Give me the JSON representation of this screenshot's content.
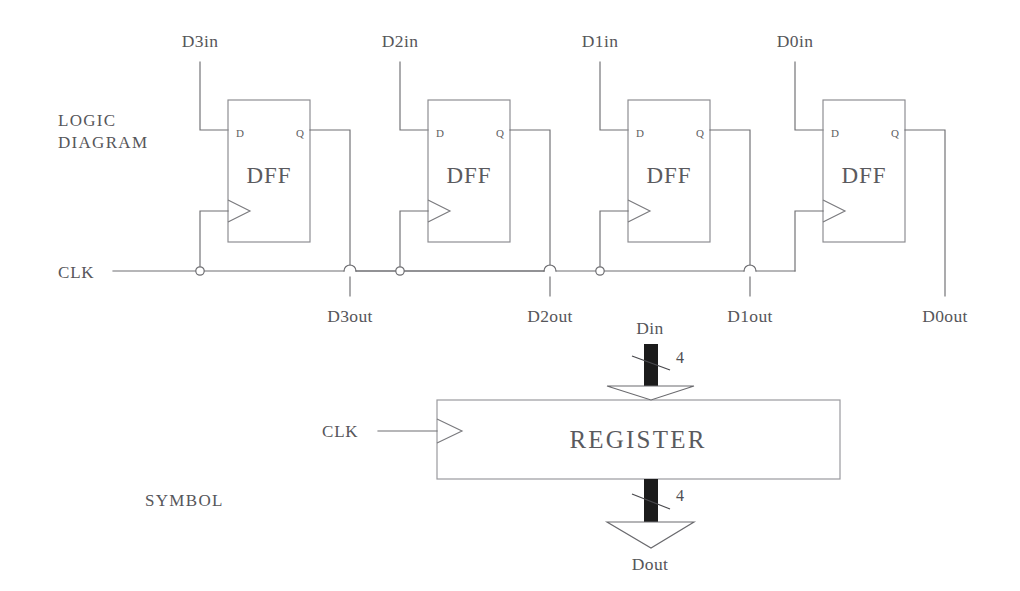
{
  "figure": {
    "sections": {
      "logic_diagram_line1": "LOGIC",
      "logic_diagram_line2": "DIAGRAM",
      "symbol": "SYMBOL"
    },
    "clock_label": "CLK",
    "logic_diagram": {
      "clock_label": "CLK",
      "flipflops": [
        {
          "name": "DFF",
          "input_label": "D3in",
          "output_label": "D3out",
          "pin_d": "D",
          "pin_q": "Q",
          "x": 228
        },
        {
          "name": "DFF",
          "input_label": "D2in",
          "output_label": "D2out",
          "pin_d": "D",
          "pin_q": "Q",
          "x": 428
        },
        {
          "name": "DFF",
          "input_label": "D1in",
          "output_label": "D1out",
          "pin_d": "D",
          "pin_q": "Q",
          "x": 628
        },
        {
          "name": "DFF",
          "input_label": "D0in",
          "output_label": "D0out",
          "pin_d": "D",
          "pin_q": "Q",
          "x": 823
        }
      ]
    },
    "symbol_block": {
      "block_label": "REGISTER",
      "clock_label": "CLK",
      "bus_in_label": "Din",
      "bus_out_label": "Dout",
      "bus_in_width": "4",
      "bus_out_width": "4"
    },
    "colors": {
      "wire": "#6e6e72",
      "text": "#56565a",
      "bus_bar": "#1b1b1b",
      "background": "#ffffff"
    }
  }
}
